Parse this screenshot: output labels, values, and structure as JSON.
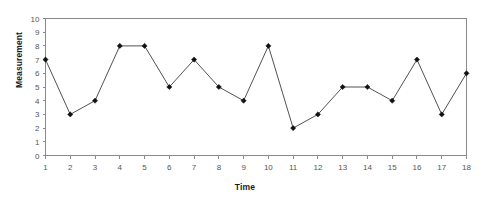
{
  "chart_data": {
    "type": "line",
    "title": "",
    "subtitle": "",
    "xlabel": "Time",
    "ylabel": "Measurement",
    "x": [
      1,
      2,
      3,
      4,
      5,
      6,
      7,
      8,
      9,
      10,
      11,
      12,
      13,
      14,
      15,
      16,
      17,
      18
    ],
    "values": [
      7,
      3,
      4,
      8,
      8,
      5,
      7,
      5,
      4,
      8,
      2,
      3,
      5,
      5,
      4,
      7,
      3,
      6
    ],
    "xlim": [
      1,
      18
    ],
    "ylim": [
      0,
      10
    ],
    "x_ticks": [
      "1",
      "2",
      "3",
      "4",
      "5",
      "6",
      "7",
      "8",
      "9",
      "10",
      "11",
      "12",
      "13",
      "14",
      "15",
      "16",
      "17",
      "18"
    ],
    "y_ticks": [
      "0",
      "1",
      "2",
      "3",
      "4",
      "5",
      "6",
      "7",
      "8",
      "9",
      "10"
    ],
    "grid": false,
    "legend": false,
    "legend_position": "none",
    "marker": "diamond",
    "line_color": "#3d3d3d",
    "marker_color": "#111111",
    "axis_color": "#8a8a8a",
    "background": "#ffffff"
  },
  "axes": {
    "y_title": "Measurement",
    "x_title": "Time"
  }
}
